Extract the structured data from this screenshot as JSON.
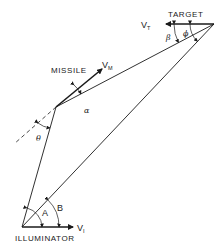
{
  "diagram": {
    "nodes": {
      "target": {
        "label": "TARGET",
        "x": 214,
        "y": 24
      },
      "missile": {
        "label": "MISSILE",
        "x": 56,
        "y": 107
      },
      "illuminator": {
        "label": "ILLUMINATOR",
        "x": 22,
        "y": 227
      }
    },
    "vectors": {
      "target_velocity": {
        "symbol": "V",
        "subscript": "T"
      },
      "missile_velocity": {
        "symbol": "V",
        "subscript": "M"
      },
      "illuminator_velocity": {
        "symbol": "V",
        "subscript": "I"
      }
    },
    "angles": {
      "beta": "β",
      "phi": "ϕ",
      "alpha": "α",
      "theta": "θ",
      "A": "A",
      "B": "B"
    },
    "colors": {
      "line": "#1a1a1a",
      "background": "#ffffff"
    }
  }
}
